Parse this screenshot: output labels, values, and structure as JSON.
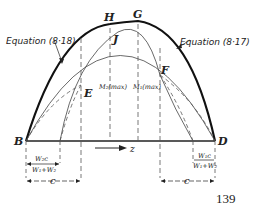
{
  "diagram": {
    "points": {
      "B": "B",
      "D": "D",
      "H": "H",
      "G": "G",
      "J": "J",
      "E": "E",
      "F": "F"
    },
    "equation_left": "Equation (8·18)",
    "equation_right": "Equation (8·17)",
    "moment_left": "M₂(max)",
    "moment_right": "M₁(max)",
    "axis_label": "z",
    "dim_left_fraction_num": "W₂c",
    "dim_left_fraction_den": "W₁+W₂",
    "dim_right_fraction_num": "W₁c",
    "dim_right_fraction_den": "W₁+W₂",
    "dim_left_c": "c",
    "dim_right_c": "c"
  },
  "page_number": "139",
  "colors": {
    "ink": "#222222",
    "background": "#ffffff"
  }
}
